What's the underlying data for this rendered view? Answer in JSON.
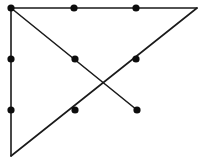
{
  "figure": {
    "kind": "geometric-line-diagram",
    "width": 206,
    "height": 165,
    "background_color": "#ffffff",
    "edge_color": "#1a1a1a",
    "node_color": "#0d0d0d",
    "edge_stroke_width": 1.6,
    "node_radius": 3.6
  },
  "chart_data": {
    "type": "scatter",
    "title": "",
    "subtitle": "",
    "xlabel": "",
    "ylabel": "",
    "grid": false,
    "legend": "none",
    "xlim": [
      0,
      206
    ],
    "ylim": [
      0,
      165
    ],
    "axis_visible": false,
    "tick_labels": [],
    "annotations": [],
    "vertices": [
      {
        "id": "top-left",
        "x": 11,
        "y": 8,
        "has_dot": true
      },
      {
        "id": "top-mid-left",
        "x": 74,
        "y": 8,
        "has_dot": true
      },
      {
        "id": "top-mid-right",
        "x": 136,
        "y": 8,
        "has_dot": true
      },
      {
        "id": "top-right",
        "x": 197,
        "y": 8,
        "has_dot": false
      },
      {
        "id": "left-upper",
        "x": 11,
        "y": 59,
        "has_dot": true
      },
      {
        "id": "center-upper",
        "x": 75,
        "y": 59,
        "has_dot": true
      },
      {
        "id": "right-upper",
        "x": 136,
        "y": 59,
        "has_dot": true
      },
      {
        "id": "left-lower",
        "x": 11,
        "y": 110,
        "has_dot": true
      },
      {
        "id": "center-lower",
        "x": 75,
        "y": 110,
        "has_dot": true
      },
      {
        "id": "diagonal-end",
        "x": 137,
        "y": 110,
        "has_dot": true
      },
      {
        "id": "bottom-left",
        "x": 11,
        "y": 156,
        "has_dot": false
      },
      {
        "id": "crossing-point",
        "x": 106,
        "y": 85,
        "has_dot": false
      }
    ],
    "edges": [
      {
        "id": "top-edge",
        "from": "top-left",
        "to": "top-right",
        "x1": 11,
        "y1": 8,
        "x2": 197,
        "y2": 8
      },
      {
        "id": "left-edge",
        "from": "top-left",
        "to": "bottom-left",
        "x1": 11,
        "y1": 8,
        "x2": 11,
        "y2": 156
      },
      {
        "id": "descending-diagonal",
        "from": "top-left",
        "to": "diagonal-end",
        "x1": 11,
        "y1": 8,
        "x2": 137,
        "y2": 110
      },
      {
        "id": "ascending-diagonal",
        "from": "bottom-left",
        "to": "top-right",
        "x1": 11,
        "y1": 156,
        "x2": 197,
        "y2": 8
      }
    ],
    "dot_count": 8,
    "edge_count": 4
  }
}
